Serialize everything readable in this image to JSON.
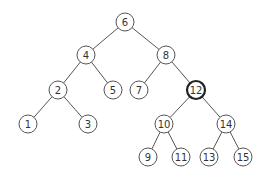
{
  "diagram": {
    "type": "binary-search-tree",
    "highlighted_node": "12",
    "nodes": [
      {
        "id": "6",
        "label": "6"
      },
      {
        "id": "4",
        "label": "4"
      },
      {
        "id": "8",
        "label": "8"
      },
      {
        "id": "2",
        "label": "2"
      },
      {
        "id": "5",
        "label": "5"
      },
      {
        "id": "7",
        "label": "7"
      },
      {
        "id": "12",
        "label": "12"
      },
      {
        "id": "1",
        "label": "1"
      },
      {
        "id": "3",
        "label": "3"
      },
      {
        "id": "10",
        "label": "10"
      },
      {
        "id": "14",
        "label": "14"
      },
      {
        "id": "9",
        "label": "9"
      },
      {
        "id": "11",
        "label": "11"
      },
      {
        "id": "13",
        "label": "13"
      },
      {
        "id": "15",
        "label": "15"
      }
    ],
    "edges": [
      [
        "6",
        "4"
      ],
      [
        "6",
        "8"
      ],
      [
        "4",
        "2"
      ],
      [
        "4",
        "5"
      ],
      [
        "8",
        "7"
      ],
      [
        "8",
        "12"
      ],
      [
        "2",
        "1"
      ],
      [
        "2",
        "3"
      ],
      [
        "12",
        "10"
      ],
      [
        "12",
        "14"
      ],
      [
        "10",
        "9"
      ],
      [
        "10",
        "11"
      ],
      [
        "14",
        "13"
      ],
      [
        "14",
        "15"
      ]
    ]
  }
}
